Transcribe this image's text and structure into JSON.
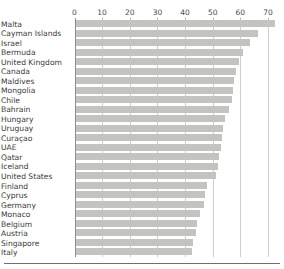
{
  "chart_data": {
    "type": "bar",
    "orientation": "horizontal",
    "title": "",
    "subtitle": "",
    "xlabel": "",
    "ylabel": "",
    "xlim": [
      0,
      72
    ],
    "axis_position": "top",
    "grid": true,
    "grid_axis": "x",
    "legend": "none",
    "bar_color": "#c3c3c0",
    "axis_color": "#8d8d8a",
    "grid_color": "#cfcfcc",
    "text_color": "#3a3a38",
    "xticks": [
      0,
      10,
      20,
      30,
      40,
      50,
      60,
      70
    ],
    "xtick_labels": [
      "0",
      "10",
      "20",
      "30",
      "40",
      "50",
      "60",
      "70"
    ],
    "categories": [
      "Malta",
      "Cayman Islands",
      "Israel",
      "Bermuda",
      "United Kingdom",
      "Canada",
      "Maldives",
      "Mongolia",
      "Chile",
      "Bahrain",
      "Hungary",
      "Uruguay",
      "Curaçao",
      "UAE",
      "Qatar",
      "Iceland",
      "United States",
      "Finland",
      "Cyprus",
      "Germany",
      "Monaco",
      "Belgium",
      "Austria",
      "Singapore",
      "Italy"
    ],
    "values": [
      72.0,
      66.0,
      63.0,
      60.5,
      59.0,
      58.0,
      57.5,
      57.0,
      56.5,
      55.5,
      54.0,
      53.5,
      53.0,
      52.5,
      52.0,
      51.5,
      51.0,
      47.5,
      47.0,
      46.5,
      45.0,
      44.0,
      43.5,
      42.5,
      42.0
    ]
  },
  "top_fragment": {
    "text": ""
  }
}
